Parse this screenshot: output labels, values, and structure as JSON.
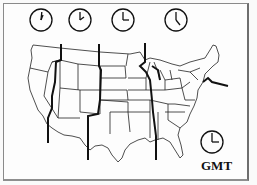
{
  "diagram": {
    "gmt_label": "GMT",
    "colors": {
      "background": "#fdfdfd",
      "line": "#111111",
      "border": "#8a8a8a"
    },
    "clocks": [
      {
        "zone": "Pacific",
        "time": "12:00",
        "cx": 41,
        "cy": 20
      },
      {
        "zone": "Mountain",
        "time": "1:00",
        "cx": 80,
        "cy": 20
      },
      {
        "zone": "Central",
        "time": "2:00",
        "cx": 123,
        "cy": 20
      },
      {
        "zone": "Eastern",
        "time": "3:00",
        "cx": 176,
        "cy": 20
      },
      {
        "zone": "GMT",
        "time": "8:00",
        "cx": 212,
        "cy": 143
      }
    ]
  }
}
